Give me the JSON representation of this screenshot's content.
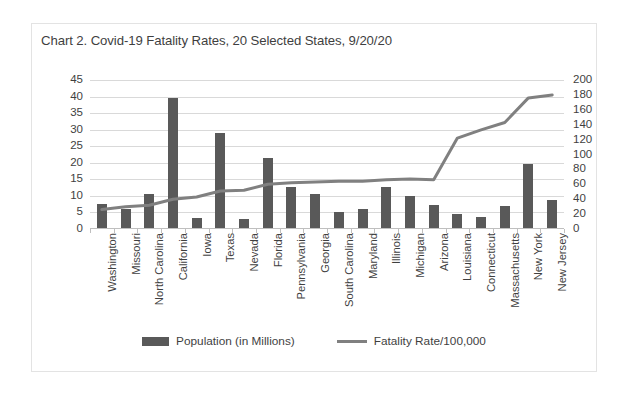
{
  "chart_data": {
    "type": "bar",
    "title": "Chart 2. Covid-19 Fatality Rates, 20 Selected States, 9/20/20",
    "xlabel": "",
    "ylabel": "",
    "grid": true,
    "legend_position": "bottom",
    "categories": [
      "Washington",
      "Missouri",
      "North Carolina",
      "California",
      "Iowa",
      "Texas",
      "Nevada",
      "Florida",
      "Pennsylvania",
      "Georgia",
      "South Carolina",
      "Maryland",
      "Illinois",
      "Michigan",
      "Arizona",
      "Louisiana",
      "Connecticut",
      "Massachusetts",
      "New York",
      "New Jersey"
    ],
    "series": [
      {
        "name": "Population (in Millions)",
        "type": "bar",
        "axis": "left",
        "color": "#595959",
        "values": [
          7.6,
          6.1,
          10.5,
          39.5,
          3.2,
          29.0,
          3.1,
          21.5,
          12.8,
          10.6,
          5.1,
          6.0,
          12.7,
          10.0,
          7.3,
          4.6,
          3.6,
          6.9,
          19.5,
          8.9
        ]
      },
      {
        "name": "Fatality Rate/100,000",
        "type": "line",
        "axis": "right",
        "color": "#808080",
        "values": [
          26,
          30,
          32,
          40,
          43,
          51,
          52,
          60,
          62,
          63,
          64,
          64,
          66,
          67,
          66,
          122,
          133,
          143,
          176,
          180
        ]
      }
    ],
    "left_axis": {
      "label": "",
      "min": 0,
      "max": 45,
      "step": 5,
      "ticks": [
        "0",
        "5",
        "10",
        "15",
        "20",
        "25",
        "30",
        "35",
        "40",
        "45"
      ]
    },
    "right_axis": {
      "label": "",
      "min": 0,
      "max": 200,
      "step": 20,
      "ticks": [
        "0",
        "20",
        "40",
        "60",
        "80",
        "100",
        "120",
        "140",
        "160",
        "180",
        "200"
      ]
    }
  },
  "legend": [
    {
      "label": "Population (in Millions)",
      "marker": "bar-swatch",
      "color": "#595959"
    },
    {
      "label": "Fatality Rate/100,000",
      "marker": "line-swatch",
      "color": "#808080"
    }
  ]
}
